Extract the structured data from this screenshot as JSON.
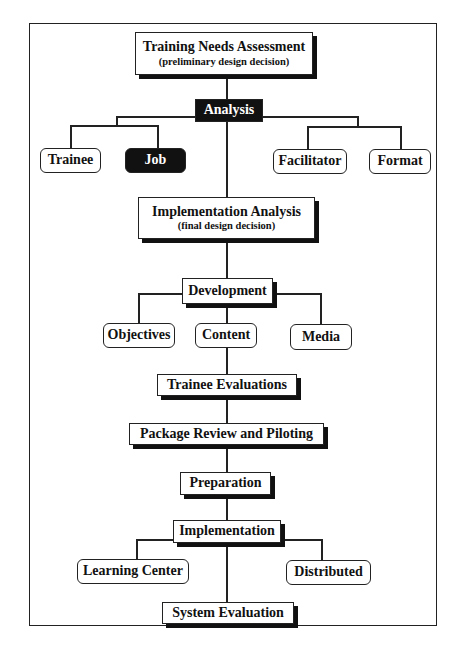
{
  "diagram": {
    "type": "flowchart",
    "nodes": {
      "tna": {
        "title": "Training Needs Assessment",
        "subtitle": "(preliminary design decision)"
      },
      "analysis": {
        "label": "Analysis"
      },
      "trainee": {
        "label": "Trainee"
      },
      "job": {
        "label": "Job"
      },
      "facilitator": {
        "label": "Facilitator"
      },
      "format": {
        "label": "Format"
      },
      "impl_analysis": {
        "title": "Implementation Analysis",
        "subtitle": "(final design decision)"
      },
      "development": {
        "label": "Development"
      },
      "objectives": {
        "label": "Objectives"
      },
      "content": {
        "label": "Content"
      },
      "media": {
        "label": "Media"
      },
      "trainee_evaluations": {
        "label": "Trainee Evaluations"
      },
      "package_review": {
        "label": "Package Review and Piloting"
      },
      "preparation": {
        "label": "Preparation"
      },
      "implementation": {
        "label": "Implementation"
      },
      "learning_center": {
        "label": "Learning Center"
      },
      "distributed": {
        "label": "Distributed"
      },
      "system_evaluation": {
        "label": "System Evaluation"
      }
    },
    "edges": [
      [
        "tna",
        "analysis"
      ],
      [
        "analysis",
        "trainee"
      ],
      [
        "analysis",
        "job"
      ],
      [
        "analysis",
        "facilitator"
      ],
      [
        "analysis",
        "format"
      ],
      [
        "analysis",
        "impl_analysis"
      ],
      [
        "impl_analysis",
        "development"
      ],
      [
        "development",
        "objectives"
      ],
      [
        "development",
        "content"
      ],
      [
        "development",
        "media"
      ],
      [
        "content",
        "trainee_evaluations"
      ],
      [
        "trainee_evaluations",
        "package_review"
      ],
      [
        "package_review",
        "preparation"
      ],
      [
        "preparation",
        "implementation"
      ],
      [
        "implementation",
        "learning_center"
      ],
      [
        "implementation",
        "distributed"
      ],
      [
        "implementation",
        "system_evaluation"
      ]
    ],
    "colors": {
      "line": "#222222",
      "dark_fill": "#111111",
      "box_fill": "#ffffff"
    }
  }
}
